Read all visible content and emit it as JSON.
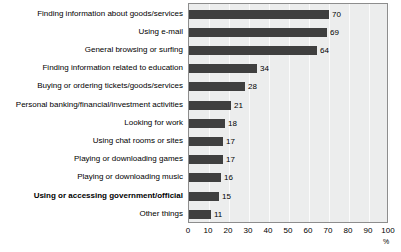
{
  "chart_data": {
    "type": "bar",
    "orientation": "horizontal",
    "title": "",
    "subtitle": "",
    "xlabel": "%",
    "ylabel": "",
    "xlim": [
      0,
      100
    ],
    "grid": true,
    "legend": null,
    "categories": [
      "Finding information about goods/services",
      "Using e-mail",
      "General browsing or surfing",
      "Finding information related to education",
      "Buying or ordering tickets/goods/services",
      "Personal banking/financial/investment activities",
      "Looking for work",
      "Using chat rooms or sites",
      "Playing or downloading games",
      "Playing or downloading music",
      "Using or accessing government/official",
      "Other things"
    ],
    "values": [
      70,
      69,
      64,
      34,
      28,
      21,
      18,
      17,
      17,
      16,
      15,
      11
    ],
    "emphasized_categories": [
      "Using or accessing government/official"
    ],
    "xticks": [
      0,
      10,
      20,
      30,
      40,
      50,
      60,
      70,
      80,
      90,
      100
    ],
    "xtick_labels": [
      "0",
      "10",
      "20",
      "30",
      "40",
      "50",
      "60",
      "70",
      "80",
      "90",
      "100"
    ],
    "colors": {
      "bar": "#3f3f3f",
      "plot_background": "#eceded",
      "gridline": "#fbfbfb",
      "axis": "#8d8d8d",
      "text": "#000000"
    }
  }
}
